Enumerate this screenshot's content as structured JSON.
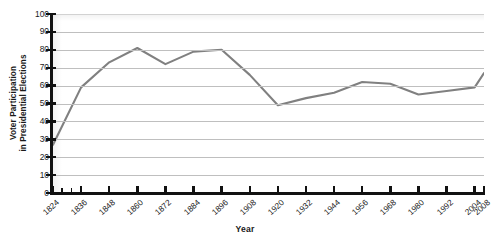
{
  "chart_data": {
    "type": "line",
    "title": "",
    "xlabel": "Year",
    "ylabel": "Voter Participation in Presidential Elections",
    "ylabel_line1": "Voter Participation",
    "ylabel_line2": "in Presidential Elections",
    "grid": true,
    "legend": "none",
    "line_color": "#808080",
    "grid_color": "#bfbfbf",
    "axis_color": "#111111",
    "xlim": [
      1824,
      2008
    ],
    "ylim": [
      0,
      100
    ],
    "yticks": [
      0,
      10,
      20,
      30,
      40,
      50,
      60,
      70,
      80,
      90,
      100
    ],
    "xticks": [
      1824,
      1836,
      1848,
      1860,
      1872,
      1884,
      1896,
      1908,
      1920,
      1932,
      1944,
      1956,
      1968,
      1980,
      1992,
      2004,
      2008
    ],
    "xticklabels": [
      "1824",
      "1836",
      "1848",
      "1860",
      "1872",
      "1884",
      "1896",
      "1908",
      "1920",
      "1932",
      "1944",
      "1956",
      "1968",
      "1980",
      "1992",
      "2004",
      "2008"
    ],
    "x": [
      1824,
      1836,
      1848,
      1860,
      1872,
      1884,
      1896,
      1908,
      1920,
      1932,
      1944,
      1956,
      1968,
      1980,
      1992,
      2004,
      2008
    ],
    "values": [
      27,
      59,
      73,
      81,
      72,
      79,
      80,
      66,
      49,
      53,
      56,
      62,
      61,
      55,
      57,
      59,
      67
    ],
    "series": [
      {
        "name": "Voter Participation",
        "values": [
          27,
          59,
          73,
          81,
          72,
          79,
          80,
          66,
          49,
          53,
          56,
          62,
          61,
          55,
          57,
          59,
          67
        ]
      }
    ],
    "minor_xticks": [
      1828,
      1832
    ]
  }
}
